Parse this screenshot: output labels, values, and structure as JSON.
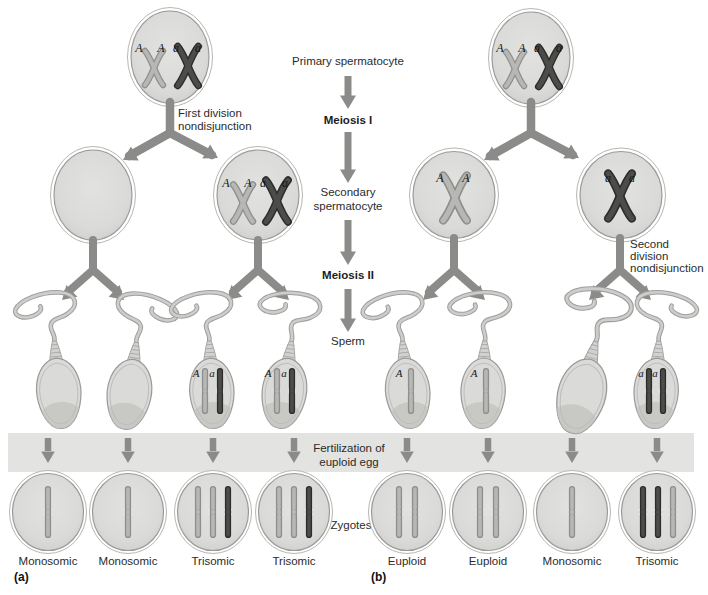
{
  "figure": {
    "panel_count": 2
  },
  "center": {
    "primary": "Primary spermatocyte",
    "meiosis1": "Meiosis I",
    "secondary_l1": "Secondary",
    "secondary_l2": "spermatocyte",
    "meiosis2": "Meiosis II",
    "sperm": "Sperm",
    "fert_l1": "Fertilization of",
    "fert_l2": "euploid egg",
    "zygotes": "Zygotes"
  },
  "panel_a": {
    "tag": "(a)",
    "nondisjunction_l1": "First division",
    "nondisjunction_l2": "nondisjunction",
    "zygote_labels": [
      "Monosomic",
      "Monosomic",
      "Trisomic",
      "Trisomic"
    ]
  },
  "panel_b": {
    "tag": "(b)",
    "nondisjunction_l1": "Second",
    "nondisjunction_l2": "division",
    "nondisjunction_l3": "nondisjunction",
    "zygote_labels": [
      "Euploid",
      "Euploid",
      "Monosomic",
      "Trisomic"
    ]
  },
  "alleles": {
    "A": "A",
    "a": "a"
  },
  "colors": {
    "background": "#ffffff",
    "cell_fill": "#dbdbd9",
    "cell_stroke": "#9b9b99",
    "band": "#e3e3e1",
    "arrow": "#8b8b89",
    "chromosome_light": "#b7b7b5",
    "chromosome_dark": "#4c4c4a",
    "sperm_head": "#dadad8",
    "text": "#2b2b2b"
  }
}
